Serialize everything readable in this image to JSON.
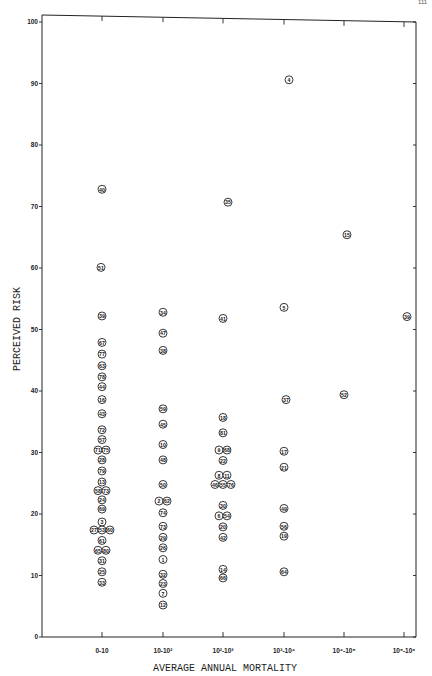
{
  "page_number": "111",
  "chart_data": {
    "type": "scatter",
    "title": "",
    "xlabel": "AVERAGE ANNUAL MORTALITY",
    "ylabel": "PERCEIVED RISK",
    "ylim": [
      0,
      100
    ],
    "yticks": [
      0,
      10,
      20,
      30,
      40,
      50,
      60,
      70,
      80,
      90,
      100
    ],
    "categories": [
      "0-10",
      "10-10²",
      "10²-10³",
      "10³-10⁴",
      "10⁴-10⁵",
      "10⁵-10⁶"
    ],
    "grid": false,
    "marker": "circled numeric label",
    "points": [
      {
        "label": "40",
        "cat": 0,
        "dx": 0,
        "y": 72.8
      },
      {
        "label": "51",
        "cat": 0,
        "dx": -1,
        "y": 60.1
      },
      {
        "label": "39",
        "cat": 0,
        "dx": 0,
        "y": 52.2
      },
      {
        "label": "67",
        "cat": 0,
        "dx": 0,
        "y": 47.9
      },
      {
        "label": "77",
        "cat": 0,
        "dx": 0,
        "y": 46.0
      },
      {
        "label": "63",
        "cat": 0,
        "dx": 0,
        "y": 44.1
      },
      {
        "label": "78",
        "cat": 0,
        "dx": 0,
        "y": 42.3
      },
      {
        "label": "44",
        "cat": 0,
        "dx": 0,
        "y": 40.7
      },
      {
        "label": "16",
        "cat": 0,
        "dx": 0,
        "y": 38.6
      },
      {
        "label": "43",
        "cat": 0,
        "dx": 0,
        "y": 36.3
      },
      {
        "label": "72",
        "cat": 0,
        "dx": 0,
        "y": 33.7
      },
      {
        "label": "57",
        "cat": 0,
        "dx": 0,
        "y": 32.1
      },
      {
        "label": "71",
        "cat": 0,
        "dx": -4,
        "y": 30.4
      },
      {
        "label": "75",
        "cat": 0,
        "dx": 4,
        "y": 30.4
      },
      {
        "label": "28",
        "cat": 0,
        "dx": 0,
        "y": 28.8
      },
      {
        "label": "79",
        "cat": 0,
        "dx": 0,
        "y": 27.0
      },
      {
        "label": "13",
        "cat": 0,
        "dx": 0,
        "y": 25.2
      },
      {
        "label": "58",
        "cat": 0,
        "dx": -4,
        "y": 23.8
      },
      {
        "label": "73",
        "cat": 0,
        "dx": 4,
        "y": 23.8
      },
      {
        "label": "24",
        "cat": 0,
        "dx": 0,
        "y": 22.3
      },
      {
        "label": "69",
        "cat": 0,
        "dx": 0,
        "y": 20.8
      },
      {
        "label": "3",
        "cat": 0,
        "dx": 0,
        "y": 18.7
      },
      {
        "label": "27",
        "cat": 0,
        "dx": -8,
        "y": 17.4
      },
      {
        "label": "53",
        "cat": 0,
        "dx": 0,
        "y": 17.4
      },
      {
        "label": "60",
        "cat": 0,
        "dx": 8,
        "y": 17.4
      },
      {
        "label": "61",
        "cat": 0,
        "dx": 0,
        "y": 15.7
      },
      {
        "label": "65",
        "cat": 0,
        "dx": -4,
        "y": 14.1
      },
      {
        "label": "80",
        "cat": 0,
        "dx": 4,
        "y": 14.1
      },
      {
        "label": "31",
        "cat": 0,
        "dx": 0,
        "y": 12.4
      },
      {
        "label": "25",
        "cat": 0,
        "dx": 0,
        "y": 10.6
      },
      {
        "label": "33",
        "cat": 0,
        "dx": 0,
        "y": 8.9
      },
      {
        "label": "34",
        "cat": 1,
        "dx": 0,
        "y": 52.8
      },
      {
        "label": "47",
        "cat": 1,
        "dx": 0,
        "y": 49.4
      },
      {
        "label": "38",
        "cat": 1,
        "dx": 0,
        "y": 46.6
      },
      {
        "label": "59",
        "cat": 1,
        "dx": 0,
        "y": 37.1
      },
      {
        "label": "45",
        "cat": 1,
        "dx": 0,
        "y": 34.6
      },
      {
        "label": "10",
        "cat": 1,
        "dx": 0,
        "y": 31.3
      },
      {
        "label": "48",
        "cat": 1,
        "dx": 0,
        "y": 28.8
      },
      {
        "label": "50",
        "cat": 1,
        "dx": 0,
        "y": 24.8
      },
      {
        "label": "2",
        "cat": 1,
        "dx": -4,
        "y": 22.1
      },
      {
        "label": "62",
        "cat": 1,
        "dx": 4,
        "y": 22.1
      },
      {
        "label": "74",
        "cat": 1,
        "dx": 0,
        "y": 20.2
      },
      {
        "label": "73",
        "cat": 1,
        "dx": 0,
        "y": 18.0
      },
      {
        "label": "29",
        "cat": 1,
        "dx": 0,
        "y": 16.2
      },
      {
        "label": "26",
        "cat": 1,
        "dx": 0,
        "y": 14.5
      },
      {
        "label": "1",
        "cat": 1,
        "dx": 0,
        "y": 12.6
      },
      {
        "label": "32",
        "cat": 1,
        "dx": 0,
        "y": 10.2
      },
      {
        "label": "23",
        "cat": 1,
        "dx": 0,
        "y": 8.7
      },
      {
        "label": "7",
        "cat": 1,
        "dx": 0,
        "y": 7.1
      },
      {
        "label": "12",
        "cat": 1,
        "dx": 0,
        "y": 5.2
      },
      {
        "label": "35",
        "cat": 2,
        "dx": 5,
        "y": 70.7
      },
      {
        "label": "41",
        "cat": 2,
        "dx": 0,
        "y": 51.8
      },
      {
        "label": "18",
        "cat": 2,
        "dx": 0,
        "y": 35.7
      },
      {
        "label": "81",
        "cat": 2,
        "dx": 0,
        "y": 33.2
      },
      {
        "label": "9",
        "cat": 2,
        "dx": -4,
        "y": 30.4
      },
      {
        "label": "68",
        "cat": 2,
        "dx": 4,
        "y": 30.4
      },
      {
        "label": "22",
        "cat": 2,
        "dx": 0,
        "y": 28.7
      },
      {
        "label": "8",
        "cat": 2,
        "dx": -4,
        "y": 26.3
      },
      {
        "label": "11",
        "cat": 2,
        "dx": 4,
        "y": 26.3
      },
      {
        "label": "46",
        "cat": 2,
        "dx": -8,
        "y": 24.8
      },
      {
        "label": "55",
        "cat": 2,
        "dx": 0,
        "y": 24.8
      },
      {
        "label": "76",
        "cat": 2,
        "dx": 8,
        "y": 24.8
      },
      {
        "label": "30",
        "cat": 2,
        "dx": 0,
        "y": 21.4
      },
      {
        "label": "6",
        "cat": 2,
        "dx": -4,
        "y": 19.7
      },
      {
        "label": "54",
        "cat": 2,
        "dx": 4,
        "y": 19.7
      },
      {
        "label": "20",
        "cat": 2,
        "dx": 0,
        "y": 17.9
      },
      {
        "label": "42",
        "cat": 2,
        "dx": 0,
        "y": 16.2
      },
      {
        "label": "14",
        "cat": 2,
        "dx": 0,
        "y": 11.0
      },
      {
        "label": "66",
        "cat": 2,
        "dx": 0,
        "y": 9.6
      },
      {
        "label": "4",
        "cat": 3,
        "dx": 5,
        "y": 90.6
      },
      {
        "label": "5",
        "cat": 3,
        "dx": 0,
        "y": 53.6
      },
      {
        "label": "37",
        "cat": 3,
        "dx": 2,
        "y": 38.6
      },
      {
        "label": "17",
        "cat": 3,
        "dx": 0,
        "y": 30.2
      },
      {
        "label": "21",
        "cat": 3,
        "dx": 0,
        "y": 27.6
      },
      {
        "label": "49",
        "cat": 3,
        "dx": 0,
        "y": 20.9
      },
      {
        "label": "56",
        "cat": 3,
        "dx": 0,
        "y": 18.0
      },
      {
        "label": "19",
        "cat": 3,
        "dx": 0,
        "y": 16.4
      },
      {
        "label": "64",
        "cat": 3,
        "dx": 0,
        "y": 10.6
      },
      {
        "label": "15",
        "cat": 4,
        "dx": 3,
        "y": 65.4
      },
      {
        "label": "52",
        "cat": 4,
        "dx": 0,
        "y": 39.4
      },
      {
        "label": "39",
        "cat": 5,
        "dx": 3,
        "y": 52.1
      }
    ]
  }
}
